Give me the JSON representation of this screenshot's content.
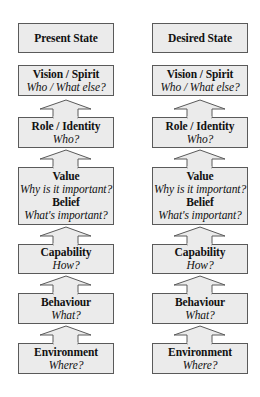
{
  "diagram": {
    "type": "logical-levels-comparison",
    "columns": [
      {
        "id": "present",
        "header": "Present State",
        "levels": [
          {
            "title": "Vision / Spirit",
            "question": "Who / What else?"
          },
          {
            "title": "Role / Identity",
            "question": "Who?"
          },
          {
            "title": "Value",
            "question": "Why is it important?",
            "title2": "Belief",
            "question2": "What's important?"
          },
          {
            "title": "Capability",
            "question": "How?"
          },
          {
            "title": "Behaviour",
            "question": "What?"
          },
          {
            "title": "Environment",
            "question": "Where?"
          }
        ]
      },
      {
        "id": "desired",
        "header": "Desired State",
        "levels": [
          {
            "title": "Vision / Spirit",
            "question": "Who / What else?"
          },
          {
            "title": "Role / Identity",
            "question": "Who?"
          },
          {
            "title": "Value",
            "question": "Why is it important?",
            "title2": "Belief",
            "question2": "What's important?"
          },
          {
            "title": "Capability",
            "question": "How?"
          },
          {
            "title": "Behaviour",
            "question": "What?"
          },
          {
            "title": "Environment",
            "question": "Where?"
          }
        ]
      }
    ],
    "arrows": {
      "direction": "up",
      "icon": "up-arrow-icon"
    },
    "colors": {
      "box_fill": "#ebebeb",
      "box_border": "#5a5a5a",
      "text": "#111111",
      "background": "#ffffff"
    }
  }
}
